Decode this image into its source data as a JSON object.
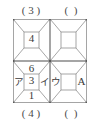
{
  "figure": {
    "type": "geometry-diagram",
    "stroke_color": "#8a8a8a",
    "outer_stroke_color": "#6e6e6e",
    "background": "#ffffff",
    "grid": {
      "columns": 2,
      "rows": 2
    }
  },
  "labels": {
    "top": [
      {
        "text": "( 3 )"
      },
      {
        "text": "(  )"
      }
    ],
    "bottom": [
      {
        "text": "( 4 )"
      },
      {
        "text": "(  )"
      }
    ]
  },
  "cells": {
    "top_left": {
      "inner_value": "4"
    },
    "top_right": {
      "inner_value": ""
    },
    "bottom_left": {
      "inner_value": "3",
      "above": "6",
      "below": "1",
      "left": "ア",
      "right": "イ"
    },
    "bottom_right": {
      "inner_value": "",
      "left": "ウ",
      "right": "A"
    }
  }
}
